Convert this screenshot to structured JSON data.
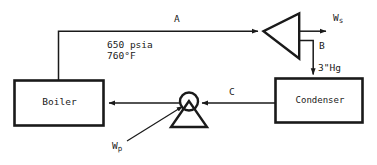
{
  "diagram": {
    "components": {
      "boiler": {
        "label": "Boiler"
      },
      "turbine": {
        "label": ""
      },
      "condenser": {
        "label": "Condenser"
      },
      "pump": {
        "label": ""
      }
    },
    "stream_labels": {
      "a": "A",
      "b": "B",
      "c": "C"
    },
    "conditions": {
      "pressure": "650 psia",
      "temperature": "760°F",
      "condenser_pressure": "3\"Hg"
    },
    "work_terms": {
      "shaft": {
        "symbol": "W",
        "subscript": "s"
      },
      "pump": {
        "symbol": "W",
        "subscript": "p"
      }
    },
    "colors": {
      "line": "#1a1a1a",
      "background": "#ffffff"
    }
  }
}
